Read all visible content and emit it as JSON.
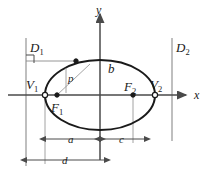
{
  "figure": {
    "colors": {
      "curve": "#1a1a1a",
      "axis": "#4a4a4a",
      "directrix": "#8a8a8a",
      "dimension": "#4a4a4a",
      "ray": "#9a9a9a",
      "label": "#1a1a1a",
      "background": "#ffffff"
    }
  },
  "axes": {
    "x_label": "x",
    "y_label": "y",
    "origin": {
      "x": 100,
      "y": 95
    },
    "x_axis": {
      "x1": 8,
      "y1": 95,
      "x2": 186,
      "y2": 95
    },
    "y_axis": {
      "x1": 100,
      "y1": 160,
      "x2": 100,
      "y2": 14
    },
    "x_label_pos": {
      "x": 194,
      "y": 99
    },
    "y_label_pos": {
      "x": 96,
      "y": 14
    }
  },
  "ellipse": {
    "center": {
      "x": 100,
      "y": 95
    },
    "semi_major_a": 55,
    "semi_minor_b": 35,
    "focal_distance_c": 33
  },
  "points": [
    {
      "name": "V1",
      "label": "V",
      "subscript": "1",
      "x": 45,
      "y": 95,
      "marker": "open",
      "label_x": 26,
      "label_y": 89
    },
    {
      "name": "F1",
      "label": "F",
      "subscript": "1",
      "x": 57,
      "y": 95,
      "marker": "filled",
      "label_x": 51,
      "label_y": 112
    },
    {
      "name": "F2",
      "label": "F",
      "subscript": "2",
      "x": 133,
      "y": 95,
      "marker": "filled",
      "label_x": 124,
      "label_y": 91
    },
    {
      "name": "V2",
      "label": "V",
      "subscript": "2",
      "x": 155,
      "y": 95,
      "marker": "open",
      "label_x": 150,
      "label_y": 89
    },
    {
      "name": "P",
      "label": "",
      "subscript": "",
      "x": 76,
      "y": 61,
      "marker": "filled",
      "label_x": 0,
      "label_y": 0
    }
  ],
  "directrices": [
    {
      "name": "D1",
      "label": "D",
      "subscript": "1",
      "x": 26,
      "y_top": 38,
      "y_bottom": 166,
      "label_x": 30,
      "label_y": 52
    },
    {
      "name": "D2",
      "label": "D",
      "subscript": "2",
      "x": 172,
      "y_top": 38,
      "y_bottom": 141,
      "label_x": 176,
      "label_y": 52
    }
  ],
  "focal_chord": {
    "from": {
      "x": 57,
      "y": 95
    },
    "to": {
      "x": 90,
      "y": 64
    },
    "label": "p",
    "label_x": 68,
    "label_y": 82,
    "segment": {
      "x1": 66,
      "y1": 68,
      "x2": 66,
      "y2": 93
    }
  },
  "perpendicular": {
    "from": {
      "x": 26,
      "y": 61
    },
    "to": {
      "x": 76,
      "y": 61
    },
    "right_angle_marker": {
      "x": 26,
      "y": 55,
      "size": 8
    }
  },
  "semi_minor_marker": {
    "label": "b",
    "label_x": 108,
    "label_y": 73
  },
  "dimensions": [
    {
      "name": "a",
      "label": "a",
      "x1": 45,
      "x2": 100,
      "y": 139,
      "label_x": 68,
      "label_y": 143,
      "tick_top": 97,
      "tick_from": "V1",
      "tick_to": "origin"
    },
    {
      "name": "c",
      "label": "c",
      "x1": 100,
      "x2": 145,
      "y": 139,
      "label_x": 119,
      "label_y": 143,
      "tick_top": 97,
      "tick_from": "origin",
      "tick_to": "F2"
    },
    {
      "name": "d",
      "label": "d",
      "x1": 26,
      "x2": 105,
      "y": 160,
      "label_x": 62,
      "label_y": 164,
      "tick_top": 97,
      "tick_from": "D1",
      "tick_to": "origin"
    }
  ]
}
